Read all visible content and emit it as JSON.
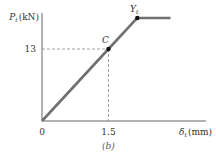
{
  "chart_data": {
    "type": "line",
    "title": "",
    "caption": "(b)",
    "ylabel": {
      "symbol": "P",
      "subscript": "t",
      "unit": "(kN)"
    },
    "xlabel": {
      "symbol": "δ",
      "subscript": "t",
      "unit": "(mm)"
    },
    "origin_label": "0",
    "x_ticks": [
      {
        "value": 1.5,
        "label": "1.5"
      }
    ],
    "y_ticks": [
      {
        "value": 13,
        "label": "13"
      }
    ],
    "xlim": [
      0,
      3.7
    ],
    "ylim": [
      0,
      19.5
    ],
    "series": [
      {
        "name": "load-deflection",
        "color": "#707070",
        "points": [
          {
            "x": 0,
            "y": 0
          },
          {
            "x": 1.5,
            "y": 13
          },
          {
            "x": 2.15,
            "y": 18.6
          },
          {
            "x": 2.9,
            "y": 18.6
          }
        ]
      }
    ],
    "annotations": [
      {
        "label": "C",
        "x": 1.5,
        "y": 13
      },
      {
        "label": "Y",
        "subscript": "t",
        "x": 2.15,
        "y": 18.6
      }
    ],
    "guides": [
      {
        "x": 1.5,
        "y": 13,
        "style": "dashed"
      }
    ],
    "grid": false,
    "legend": "none"
  }
}
